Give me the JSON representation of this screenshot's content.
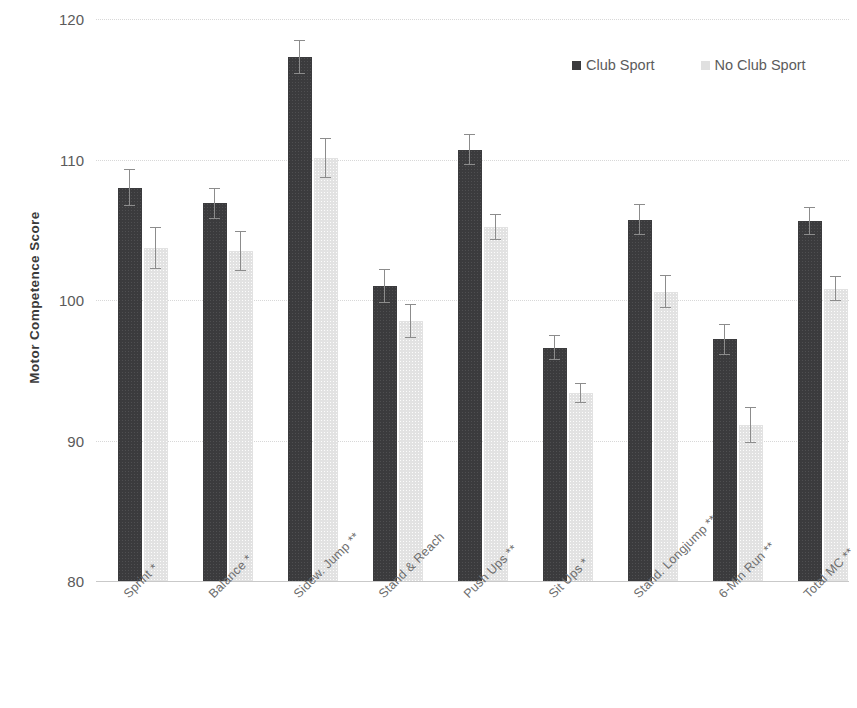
{
  "chart_data": {
    "type": "bar",
    "title": "",
    "xlabel": "",
    "ylabel": "Motor Competence  Score",
    "ylim": [
      80,
      120
    ],
    "yticks": [
      80,
      90,
      100,
      110,
      120
    ],
    "grid": true,
    "legend_position": "top-right",
    "colors": {
      "club_sport": "#3b3b3d",
      "no_club_sport": "#e2e2e2"
    },
    "categories": [
      "Sprint *",
      "Balance *",
      "Sidew. Jump **",
      "Stand & Reach",
      "Push Ups **",
      "Sit Ups *",
      "Stand. Longjump **",
      "6-Min Run **",
      "Total MC **"
    ],
    "series": [
      {
        "name": "Club Sport",
        "values": [
          108.0,
          106.9,
          117.3,
          101.0,
          110.7,
          96.6,
          105.7,
          97.2,
          105.6
        ],
        "errors": [
          1.3,
          1.1,
          1.2,
          1.2,
          1.1,
          0.9,
          1.1,
          1.1,
          1.0
        ]
      },
      {
        "name": "No Club Sport",
        "values": [
          103.7,
          103.5,
          110.1,
          98.5,
          105.2,
          93.4,
          100.6,
          91.1,
          100.8
        ],
        "errors": [
          1.5,
          1.4,
          1.4,
          1.2,
          0.9,
          0.7,
          1.2,
          1.3,
          0.9
        ]
      }
    ]
  },
  "legend": {
    "entries": [
      {
        "label": "Club Sport"
      },
      {
        "label": "No Club Sport"
      }
    ]
  },
  "axis": {
    "y_title": "Motor Competence  Score",
    "y_tick_labels": [
      "120",
      "110",
      "100",
      "90",
      "80"
    ]
  }
}
